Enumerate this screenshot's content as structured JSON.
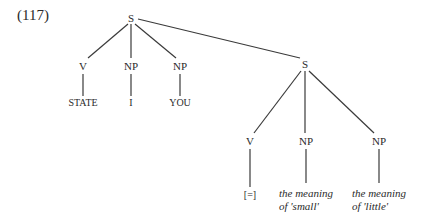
{
  "example_number": "(117)",
  "tree": {
    "root": {
      "label": "S"
    },
    "level1": [
      {
        "label": "V",
        "leaf": "STATE"
      },
      {
        "label": "NP",
        "leaf": "I"
      },
      {
        "label": "NP",
        "leaf": "YOU"
      },
      {
        "label": "S"
      }
    ],
    "embedded": [
      {
        "label": "V",
        "leaf": "[=]"
      },
      {
        "label": "NP",
        "leaf_line1": "the meaning",
        "leaf_line2": "of 'small'"
      },
      {
        "label": "NP",
        "leaf_line1": "the meaning",
        "leaf_line2": "of 'little'"
      }
    ]
  }
}
